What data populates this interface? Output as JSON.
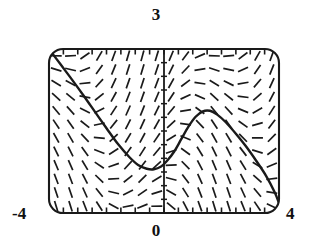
{
  "figure": {
    "kind": "slope-field-with-solution-curve",
    "background_color": "#ffffff",
    "ink_color": "#1a1a1a"
  },
  "labels": {
    "top": "3",
    "bottom": "0",
    "left": "-4",
    "right": "4"
  },
  "chart_data": {
    "type": "scatter",
    "title": "",
    "subtitle": "",
    "xlabel": "",
    "ylabel": "",
    "xlim": [
      -4,
      4
    ],
    "ylim": [
      0,
      3
    ],
    "grid": false,
    "legend": null,
    "frame": {
      "style": "rounded-rectangle",
      "corner_radius_px": 14,
      "left_px": 49,
      "top_px": 49,
      "right_px": 279,
      "bottom_px": 213
    },
    "axes": {
      "x_axis": {
        "drawn_as": "bottom-frame-edge",
        "tick_count": 17,
        "tick_labels": [
          "-4",
          "",
          "",
          "",
          "",
          "",
          "",
          "",
          "0",
          "",
          "",
          "",
          "",
          "",
          "",
          "",
          "4"
        ],
        "tick_values": [
          -4,
          -3.5,
          -3,
          -2.5,
          -2,
          -1.5,
          -1,
          -0.5,
          0,
          0.5,
          1,
          1.5,
          2,
          2.5,
          3,
          3.5,
          4
        ]
      },
      "y_axis": {
        "drawn_as": "vertical-line-at-x-0",
        "tick_count": 13,
        "tick_labels": [
          "0",
          "",
          "",
          "",
          "",
          "",
          "",
          "",
          "",
          "",
          "",
          "",
          "3"
        ],
        "tick_values": [
          0,
          0.25,
          0.5,
          0.75,
          1,
          1.25,
          1.5,
          1.75,
          2,
          2.25,
          2.5,
          2.75,
          3
        ]
      }
    },
    "slope_field": {
      "description": "short line segments showing dy/dx at a grid of sample points",
      "columns": 16,
      "rows": 12,
      "x_samples": [
        -3.75,
        -3.25,
        -2.75,
        -2.25,
        -1.75,
        -1.25,
        -0.75,
        -0.25,
        0.25,
        0.75,
        1.25,
        1.75,
        2.25,
        2.75,
        3.25,
        3.75
      ],
      "y_samples": [
        0.125,
        0.375,
        0.625,
        0.875,
        1.125,
        1.375,
        1.625,
        1.875,
        2.125,
        2.375,
        2.625,
        2.875
      ],
      "segment_length_px": 11,
      "slope_formula_note": "slopes negative-left of the curve trough, positive rising toward the right hump"
    },
    "solution_curve": {
      "description": "one solution trajectory threaded through the slope field",
      "points_xy": [
        [
          -4.0,
          3.0
        ],
        [
          -3.6,
          2.72
        ],
        [
          -3.2,
          2.44
        ],
        [
          -2.8,
          2.15
        ],
        [
          -2.4,
          1.85
        ],
        [
          -2.0,
          1.55
        ],
        [
          -1.6,
          1.26
        ],
        [
          -1.2,
          1.02
        ],
        [
          -0.9,
          0.88
        ],
        [
          -0.6,
          0.81
        ],
        [
          -0.35,
          0.8
        ],
        [
          -0.1,
          0.85
        ],
        [
          0.1,
          0.95
        ],
        [
          0.35,
          1.12
        ],
        [
          0.6,
          1.35
        ],
        [
          0.85,
          1.58
        ],
        [
          1.1,
          1.76
        ],
        [
          1.35,
          1.86
        ],
        [
          1.6,
          1.87
        ],
        [
          1.85,
          1.8
        ],
        [
          2.15,
          1.66
        ],
        [
          2.5,
          1.45
        ],
        [
          2.85,
          1.22
        ],
        [
          3.2,
          0.96
        ],
        [
          3.55,
          0.68
        ],
        [
          3.85,
          0.38
        ],
        [
          4.0,
          0.18
        ]
      ],
      "local_minimum_xy": [
        -0.38,
        0.8
      ],
      "local_maximum_xy": [
        1.55,
        1.87
      ],
      "y_intercept": 0.93
    }
  }
}
